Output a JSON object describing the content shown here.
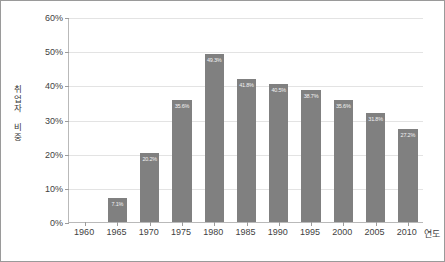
{
  "chart_data": {
    "type": "bar",
    "title": "",
    "subtitle": "",
    "xlabel": "연도",
    "ylabel": "취업자 비중",
    "ylabel_chars": "취\n업\n자\n\n비\n중",
    "categories": [
      "1960",
      "1965",
      "1970",
      "1975",
      "1980",
      "1985",
      "1990",
      "1995",
      "2000",
      "2005",
      "2010"
    ],
    "values": [
      0,
      7.1,
      20.2,
      35.6,
      49.3,
      41.8,
      40.5,
      38.7,
      35.6,
      31.8,
      27.2
    ],
    "value_labels": [
      "",
      "7.1%",
      "20.2%",
      "35.6%",
      "49.3%",
      "41.8%",
      "40.5%",
      "38.7%",
      "35.6%",
      "31.8%",
      "27.2%"
    ],
    "ylim": [
      0,
      60
    ],
    "ytick_values": [
      0,
      10,
      20,
      30,
      40,
      50,
      60
    ],
    "ytick_labels": [
      "0%",
      "10%",
      "20%",
      "30%",
      "40%",
      "50%",
      "60%"
    ],
    "grid": true,
    "grid_axis": "y",
    "legend": false,
    "legend_position": "none",
    "bar_color": "#808080",
    "bar_label_color": "#f2f2f2",
    "gridline_color": "#e3e3e3",
    "axis_color": "#b9b9b9",
    "text_color": "#3f3f3f",
    "background_color": "#ffffff",
    "border_color": "#9a9a9a"
  }
}
